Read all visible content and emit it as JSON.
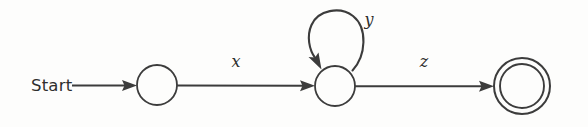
{
  "diagram": {
    "type": "finite-state-machine",
    "title": "",
    "background_color": "#fdfdfc",
    "stroke_color": "#3c3c3c",
    "text_color": "#2e2e2e",
    "start_label": "Start",
    "states": [
      {
        "id": "s0",
        "label": "",
        "kind": "normal",
        "cx": 157,
        "cy": 85,
        "r": 20
      },
      {
        "id": "s1",
        "label": "",
        "kind": "normal",
        "cx": 335,
        "cy": 86,
        "r": 20
      },
      {
        "id": "s2",
        "label": "",
        "kind": "accepting",
        "cx": 522,
        "cy": 86,
        "r_outer": 28,
        "r_inner": 22
      }
    ],
    "transitions": [
      {
        "id": "t-start",
        "from": "start-arrow",
        "to": "s0",
        "label": ""
      },
      {
        "id": "t-x",
        "from": "s0",
        "to": "s1",
        "label": "x",
        "label_x": 236,
        "label_y": 67
      },
      {
        "id": "t-y",
        "from": "s1",
        "to": "s1",
        "label": "y",
        "label_x": 369,
        "label_y": 25,
        "self_loop": true
      },
      {
        "id": "t-z",
        "from": "s1",
        "to": "s2",
        "label": "z",
        "label_x": 424,
        "label_y": 67
      }
    ]
  }
}
